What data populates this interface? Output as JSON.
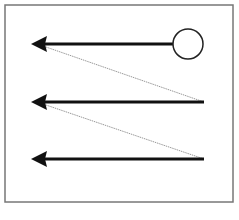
{
  "diagram": {
    "type": "zigzag-scan-pattern",
    "colors": {
      "background": "#ffffff",
      "frame": "#777777",
      "arrow": "#111111",
      "connector": "#999999",
      "circle_stroke": "#222222"
    },
    "frame": {
      "x": 5,
      "y": 5,
      "width": 228,
      "height": 197
    },
    "start_marker": {
      "shape": "circle",
      "cx": 188,
      "cy": 44,
      "r": 15
    },
    "arrows": [
      {
        "x1": 173,
        "y1": 44,
        "x2": 31,
        "y2": 44
      },
      {
        "x1": 204,
        "y1": 102,
        "x2": 31,
        "y2": 102
      },
      {
        "x1": 204,
        "y1": 159,
        "x2": 31,
        "y2": 159
      }
    ],
    "connectors": [
      {
        "x1": 46,
        "y1": 47,
        "x2": 204,
        "y2": 102
      },
      {
        "x1": 46,
        "y1": 105,
        "x2": 204,
        "y2": 159
      }
    ]
  }
}
